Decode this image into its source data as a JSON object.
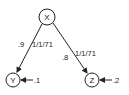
{
  "diagram": {
    "nodes": [
      {
        "id": "X",
        "label": "X"
      },
      {
        "id": "Y",
        "label": "Y"
      },
      {
        "id": "Z",
        "label": "Z"
      }
    ],
    "edges": [
      {
        "from": "X",
        "to": "Y",
        "weight": ".9",
        "annotation": "1/1/71"
      },
      {
        "from": "X",
        "to": "Z",
        "weight": ".8",
        "annotation": "1/1/71"
      }
    ],
    "external_inputs": [
      {
        "to": "Y",
        "label": ".1"
      },
      {
        "to": "Z",
        "label": ".2"
      }
    ],
    "colors": {
      "stroke": "#222222",
      "background": "#ffffff"
    }
  }
}
